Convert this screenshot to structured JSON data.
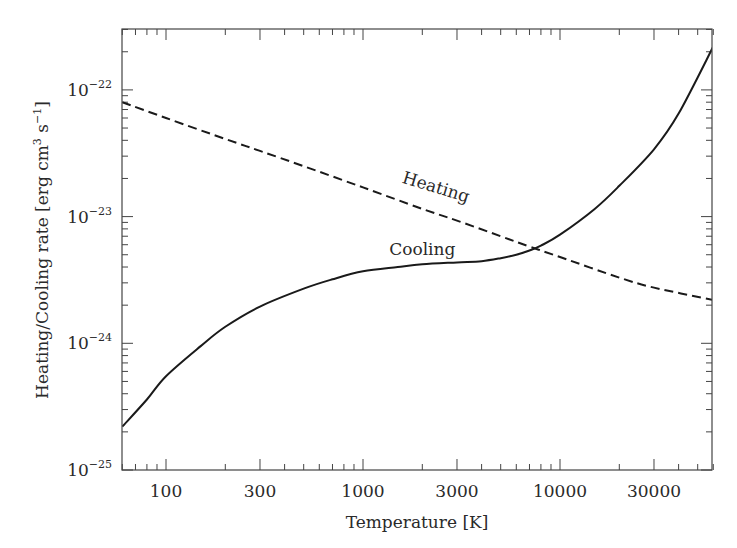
{
  "chart_data": {
    "type": "line",
    "title": "",
    "xlabel": "Temperature [K]",
    "ylabel": "Heating/Cooling rate [erg cm^3 s^-1]",
    "xscale": "log",
    "yscale": "log",
    "xlim": [
      60,
      60000
    ],
    "ylim": [
      1e-25,
      3e-22
    ],
    "grid": false,
    "legend": null,
    "x_ticks": [
      100,
      300,
      1000,
      3000,
      10000,
      30000
    ],
    "x_tick_labels": [
      "100",
      "300",
      "1000",
      "3000",
      "10000",
      "30000"
    ],
    "y_ticks": [
      1e-22,
      1e-23,
      1e-24,
      1e-25
    ],
    "y_tick_labels": [
      {
        "base": "10",
        "exp": "−22"
      },
      {
        "base": "10",
        "exp": "−23"
      },
      {
        "base": "10",
        "exp": "−24"
      },
      {
        "base": "10",
        "exp": "−25"
      }
    ],
    "annotations": [
      {
        "text": "Heating",
        "x": 2300,
        "y": 1.55e-23,
        "rotation": 17
      },
      {
        "text": "Cooling",
        "x": 2000,
        "y": 5e-24,
        "rotation": 0
      }
    ],
    "series": [
      {
        "name": "Heating",
        "style": "dashed",
        "color": "#1a1a1a",
        "x": [
          60,
          100,
          200,
          300,
          500,
          1000,
          2000,
          3000,
          5000,
          7000,
          10000,
          20000,
          30000,
          60000
        ],
        "values": [
          8e-23,
          6e-23,
          4.1e-23,
          3.3e-23,
          2.5e-23,
          1.7e-23,
          1.15e-23,
          9.3e-24,
          7e-24,
          5.8e-24,
          4.8e-24,
          3.3e-24,
          2.75e-24,
          2.2e-24
        ]
      },
      {
        "name": "Cooling",
        "style": "solid",
        "color": "#1a1a1a",
        "x": [
          60,
          80,
          100,
          150,
          200,
          300,
          500,
          700,
          1000,
          1500,
          2000,
          3000,
          4000,
          5000,
          6000,
          7000,
          8000,
          10000,
          15000,
          20000,
          30000,
          40000,
          60000
        ],
        "values": [
          2.2e-25,
          3.6e-25,
          5.5e-25,
          9.5e-25,
          1.35e-24,
          1.95e-24,
          2.7e-24,
          3.2e-24,
          3.7e-24,
          4e-24,
          4.2e-24,
          4.35e-24,
          4.45e-24,
          4.7e-24,
          5e-24,
          5.4e-24,
          5.9e-24,
          7.2e-24,
          1.15e-23,
          1.75e-23,
          3.4e-23,
          6.5e-23,
          2.2e-22
        ]
      }
    ]
  }
}
